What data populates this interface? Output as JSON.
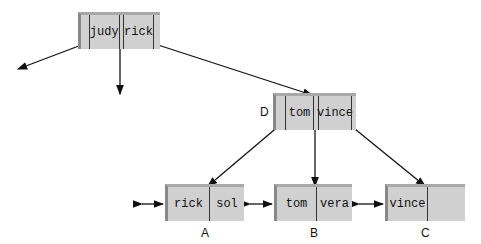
{
  "root": {
    "keys": [
      "judy",
      "rick"
    ]
  },
  "node_d": {
    "label": "D",
    "keys": [
      "tom",
      "vince"
    ]
  },
  "leaves": [
    {
      "label": "A",
      "keys": [
        "rick",
        "sol"
      ]
    },
    {
      "label": "B",
      "keys": [
        "tom",
        "vera"
      ]
    },
    {
      "label": "C",
      "keys": [
        "vince",
        ""
      ]
    }
  ]
}
